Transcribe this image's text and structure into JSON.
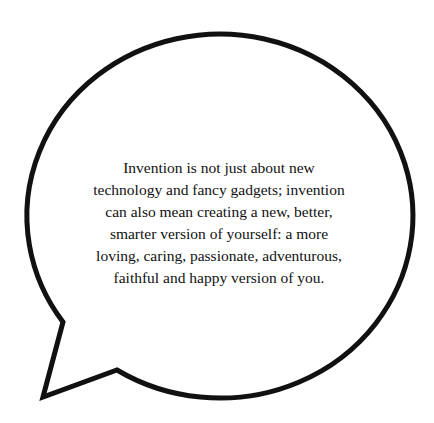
{
  "bubble": {
    "stroke_color": "#111111",
    "fill_color": "#ffffff"
  },
  "quote": {
    "lines": [
      "Invention is not just about new",
      "technology and fancy gadgets; invention",
      "can also mean creating a new, better,",
      "smarter version of yourself: a more",
      "loving, caring, passionate, adventurous,",
      "faithful and happy version of you."
    ]
  }
}
